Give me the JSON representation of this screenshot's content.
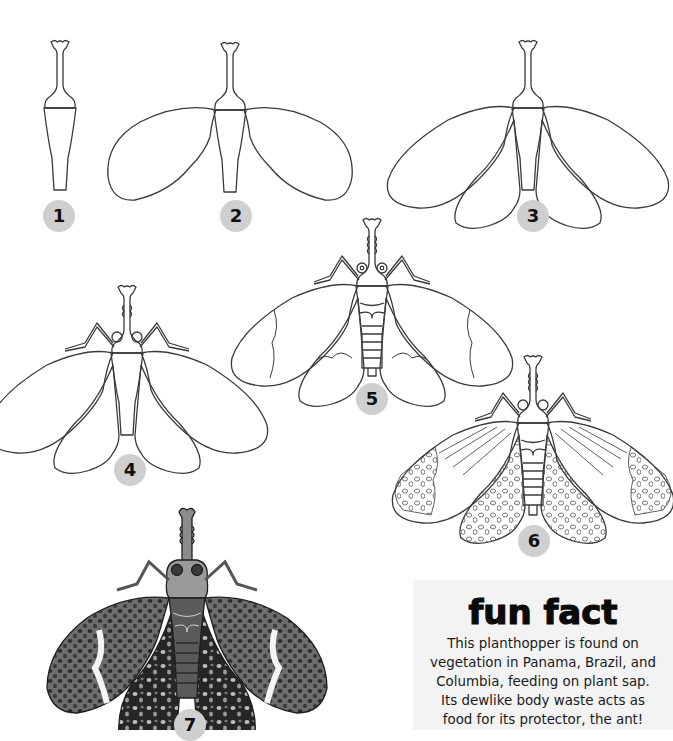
{
  "steps": [
    {
      "number": "1",
      "badge": {
        "x": 43,
        "y": 200
      }
    },
    {
      "number": "2",
      "badge": {
        "x": 220,
        "y": 200
      }
    },
    {
      "number": "3",
      "badge": {
        "x": 517,
        "y": 200
      }
    },
    {
      "number": "4",
      "badge": {
        "x": 114,
        "y": 454
      }
    },
    {
      "number": "5",
      "badge": {
        "x": 356,
        "y": 383
      }
    },
    {
      "number": "6",
      "badge": {
        "x": 518,
        "y": 525
      }
    },
    {
      "number": "7",
      "badge": {
        "x": 174,
        "y": 709
      }
    }
  ],
  "fun_fact": {
    "title": "fun fact",
    "lines": [
      "This planthopper is found on",
      "vegetation in Panama, Brazil, and",
      "Columbia, feeding on plant sap.",
      "Its dewlike body waste acts as",
      "food for its protector, the ant!"
    ]
  },
  "colors": {
    "badge_fill": "#cfcfcf",
    "line": "#3a3a3a",
    "fun_box_bg": "#f3f3f3"
  }
}
